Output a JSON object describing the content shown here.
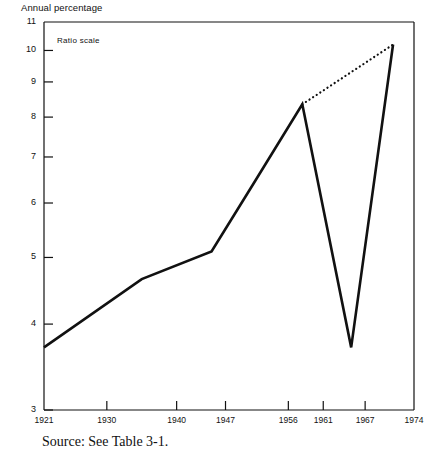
{
  "figure": {
    "axis_title": "Annual percentage",
    "annotation": "Ratio scale",
    "source_note": "Source:  See Table 3-1."
  },
  "chart_data": {
    "type": "line",
    "title": "Annual percentage",
    "subtitle": "",
    "annotations": [
      "Ratio scale"
    ],
    "xlabel": "",
    "ylabel": "Annual percentage",
    "scale": "log",
    "grid": false,
    "legend": "none",
    "xlim": [
      1921,
      1974
    ],
    "ylim": [
      3,
      11
    ],
    "xticks": [
      1921,
      1930,
      1940,
      1947,
      1956,
      1961,
      1967,
      1974
    ],
    "xtick_labels": [
      "1921",
      "1930",
      "1940",
      "1947",
      "1956",
      "1961",
      "1967",
      "1974"
    ],
    "yticks": [
      3,
      4,
      5,
      6,
      7,
      8,
      9,
      10,
      11
    ],
    "ytick_labels": [
      "3",
      "4",
      "5",
      "6",
      "7",
      "8",
      "9",
      "10",
      "11"
    ],
    "series": [
      {
        "name": "interest rate",
        "style": "solid",
        "x": [
          1921,
          1935,
          1945,
          1951,
          1958,
          1965,
          1971
        ],
        "y": [
          3.7,
          4.65,
          5.1,
          6.4,
          8.35,
          3.7,
          10.2
        ]
      },
      {
        "name": "trend projection",
        "style": "dotted",
        "x": [
          1958,
          1971
        ],
        "y": [
          8.35,
          10.2
        ]
      }
    ]
  }
}
